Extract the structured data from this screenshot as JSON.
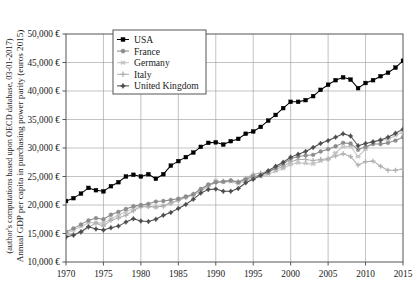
{
  "axes": {
    "ylabel_line1": "Annual GDP per capita in purchasing power parity (euros 2015)",
    "ylabel_line2": "(author's computations based upon OECD database, 03-01-2017)",
    "y_ticks": [
      "10,000 €",
      "15,000 €",
      "20,000 €",
      "25,000 €",
      "30,000 €",
      "35,000 €",
      "40,000 €",
      "45,000 €",
      "50,000 €"
    ],
    "x_ticks": [
      "1970",
      "1975",
      "1980",
      "1985",
      "1990",
      "1995",
      "2000",
      "2005",
      "2010",
      "2015"
    ]
  },
  "legend": {
    "items": [
      {
        "label": "USA",
        "marker": "square",
        "color": "#000000"
      },
      {
        "label": "France",
        "marker": "circle",
        "color": "#8c8c8c"
      },
      {
        "label": "Germany",
        "marker": "star",
        "color": "#c3c3c3"
      },
      {
        "label": "Italy",
        "marker": "plus",
        "color": "#b0b0b0"
      },
      {
        "label": "United Kingdom",
        "marker": "diamond",
        "color": "#4d4d4d"
      }
    ]
  },
  "chart_data": {
    "type": "line",
    "title": "",
    "xlabel": "",
    "ylabel": "Annual GDP per capita in purchasing power parity (euros 2015)",
    "xlim": [
      1970,
      2015
    ],
    "ylim": [
      10000,
      50000
    ],
    "grid": true,
    "legend_position": "top-left-inside",
    "x": [
      1970,
      1971,
      1972,
      1973,
      1974,
      1975,
      1976,
      1977,
      1978,
      1979,
      1980,
      1981,
      1982,
      1983,
      1984,
      1985,
      1986,
      1987,
      1988,
      1989,
      1990,
      1991,
      1992,
      1993,
      1994,
      1995,
      1996,
      1997,
      1998,
      1999,
      2000,
      2001,
      2002,
      2003,
      2004,
      2005,
      2006,
      2007,
      2008,
      2009,
      2010,
      2011,
      2012,
      2013,
      2014,
      2015
    ],
    "series": [
      {
        "name": "USA",
        "color": "#000000",
        "marker": "square",
        "values": [
          20700,
          21200,
          22000,
          23000,
          22600,
          22400,
          23300,
          24000,
          25000,
          25300,
          25000,
          25400,
          24600,
          25400,
          26900,
          27700,
          28400,
          29200,
          30200,
          30900,
          31000,
          30600,
          31200,
          31600,
          32500,
          32900,
          33700,
          34800,
          35800,
          37000,
          38100,
          38100,
          38400,
          39100,
          40200,
          41100,
          41900,
          42400,
          42000,
          40500,
          41400,
          41900,
          42600,
          43200,
          44100,
          45300
        ]
      },
      {
        "name": "France",
        "color": "#8c8c8c",
        "marker": "circle",
        "values": [
          15300,
          15900,
          16600,
          17300,
          17700,
          17500,
          18300,
          18800,
          19300,
          19800,
          20000,
          20200,
          20600,
          20700,
          20900,
          21100,
          21500,
          21900,
          22800,
          23600,
          24000,
          24100,
          24300,
          24000,
          24500,
          25000,
          25200,
          25700,
          26500,
          27200,
          28100,
          28500,
          28700,
          28800,
          29400,
          29800,
          30300,
          30900,
          30800,
          29700,
          30200,
          30700,
          30700,
          30900,
          31300,
          31900
        ],
        "note": "Values redrawn in overlapping cluster 2011-2015 converging near 33,500"
      },
      {
        "name": "Germany",
        "color": "#c3c3c3",
        "marker": "star",
        "values": [
          15000,
          15600,
          16200,
          16900,
          16900,
          16800,
          17600,
          18200,
          18800,
          19500,
          19800,
          19800,
          19600,
          19900,
          20400,
          20900,
          21400,
          21700,
          22400,
          23200,
          24300,
          24000,
          24100,
          23700,
          24300,
          24700,
          25000,
          25400,
          25900,
          26400,
          27100,
          27400,
          27300,
          27200,
          27700,
          28000,
          29200,
          30200,
          30300,
          28500,
          29800,
          31000,
          31300,
          31500,
          32200,
          32800
        ]
      },
      {
        "name": "Italy",
        "color": "#b0b0b0",
        "marker": "plus",
        "values": [
          14700,
          14900,
          15200,
          16100,
          16800,
          16300,
          17300,
          17700,
          18200,
          19000,
          19700,
          19700,
          19700,
          19800,
          20300,
          20800,
          21300,
          21900,
          22700,
          23400,
          23900,
          24200,
          24300,
          24100,
          24700,
          25400,
          25600,
          25900,
          26300,
          26700,
          27600,
          28000,
          28000,
          27800,
          28000,
          28100,
          28600,
          29000,
          28500,
          27000,
          27600,
          27700,
          26800,
          26100,
          26100,
          26300
        ]
      },
      {
        "name": "United Kingdom",
        "color": "#4d4d4d",
        "marker": "diamond",
        "values": [
          14400,
          14700,
          15300,
          16200,
          15800,
          15600,
          16000,
          16300,
          17000,
          17600,
          17200,
          17100,
          17500,
          18200,
          18700,
          19400,
          20100,
          21000,
          22100,
          22700,
          22800,
          22400,
          22400,
          22900,
          23900,
          24500,
          25200,
          26000,
          26800,
          27500,
          28400,
          28900,
          29400,
          30100,
          30800,
          31300,
          31900,
          32500,
          32100,
          30400,
          30800,
          31100,
          31400,
          31900,
          32600,
          33300
        ]
      }
    ]
  }
}
